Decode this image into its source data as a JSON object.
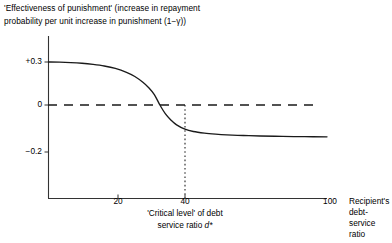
{
  "chart_data": {
    "type": "line",
    "title": "'Effectiveness of punishment' (increase in repayment\nprobability per unit increase in punishment (1−γ))",
    "xlabel": "Recipient's\ndebt-service\nratio",
    "ylabel": "",
    "xlim": [
      0,
      100
    ],
    "ylim": [
      -0.32,
      0.38
    ],
    "grid": false,
    "legend": null,
    "x_ticks": [
      20,
      40,
      100
    ],
    "x_tick_labels": [
      "20",
      "40",
      "100"
    ],
    "y_ticks": [
      0.3,
      0,
      -0.2
    ],
    "y_tick_labels": [
      "+0.3",
      "0",
      "−0.2"
    ],
    "series": [
      {
        "name": "Effectiveness of punishment",
        "x": [
          0,
          4,
          8,
          12,
          16,
          20,
          24,
          28,
          31,
          34,
          36,
          38,
          40,
          42,
          44,
          46,
          49,
          52,
          56,
          60,
          64,
          70,
          76,
          84,
          92,
          100
        ],
        "values": [
          0.3,
          0.299,
          0.296,
          0.291,
          0.283,
          0.272,
          0.255,
          0.228,
          0.199,
          0.157,
          0.12,
          0.073,
          0.0,
          -0.062,
          -0.106,
          -0.139,
          -0.169,
          -0.185,
          -0.196,
          -0.203,
          -0.208,
          -0.213,
          -0.216,
          -0.219,
          -0.221,
          -0.222
        ]
      }
    ],
    "annotations": [
      {
        "name": "zero-reference-line",
        "type": "hline",
        "y": 0,
        "style": "dashed",
        "x_from": 0,
        "x_to": 96
      },
      {
        "name": "critical-level-line",
        "type": "vline",
        "x": 40,
        "style": "dotted",
        "y_from": 0,
        "y_to": -0.32,
        "label": "'Critical level' of debt\nservice ratio d*",
        "label_math_symbol": "d*"
      }
    ],
    "curve_description": "Smooth decreasing sigmoid falling from a plateau of +0.3 through zero at a debt-service ratio of 40 to an asymptote near −0.22"
  },
  "axis_labels": {
    "y_plus_03": "+0.3",
    "y_zero": "0",
    "y_minus_02": "−0.2",
    "x_20": "20",
    "x_40": "40",
    "x_100": "100"
  },
  "annotation_text": {
    "critical_line_1": "'Critical level' of debt",
    "critical_line_2_prefix": "service ratio ",
    "critical_line_2_symbol": "d*"
  },
  "colors": {
    "background": "#ffffff",
    "ink": "#000000",
    "curve": "#1a1a1a",
    "axis": "#333333"
  }
}
